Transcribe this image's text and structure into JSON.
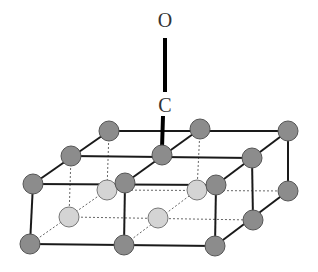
{
  "figure": {
    "labels": {
      "oxygen": "O",
      "carbon": "C"
    },
    "colors": {
      "surface_atom": "#8c8c8c",
      "subsurface_atom": "#d4d4d4",
      "atom_stroke": "#555555",
      "edge": "#1a1a1a",
      "hidden_edge": "#666666",
      "bond": "#000000"
    }
  }
}
